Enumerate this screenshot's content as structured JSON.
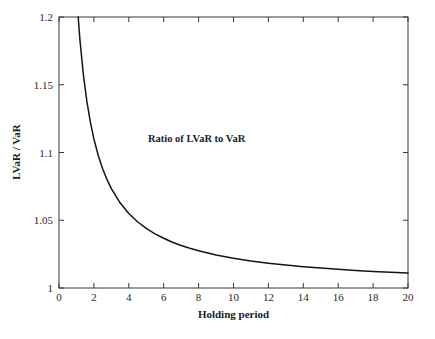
{
  "chart_data": {
    "type": "line",
    "title": "",
    "xlabel": "Holding period",
    "ylabel": "LVaR / VaR",
    "xlim": [
      0,
      20
    ],
    "ylim": [
      1,
      1.2
    ],
    "grid": false,
    "legend_position": "none",
    "annotations": [
      {
        "text": "Ratio of LVaR to VaR",
        "x": 5.1,
        "y": 1.108
      }
    ],
    "xticks": [
      "0",
      "2",
      "4",
      "6",
      "8",
      "10",
      "12",
      "14",
      "16",
      "18",
      "20"
    ],
    "xtick_values": [
      0,
      2,
      4,
      6,
      8,
      10,
      12,
      14,
      16,
      18,
      20
    ],
    "yticks": [
      "1",
      "1.05",
      "1.1",
      "1.15",
      "1.2"
    ],
    "ytick_values": [
      1,
      1.05,
      1.1,
      1.15,
      1.2
    ],
    "series": [
      {
        "name": "Ratio of LVaR to VaR",
        "formula": "1 + 0.22/t",
        "color": "#151313",
        "x": [
          1.1,
          1.2,
          1.4,
          1.6,
          1.8,
          2.0,
          2.25,
          2.5,
          2.75,
          3.0,
          3.5,
          4.0,
          4.5,
          5.0,
          5.5,
          6.0,
          6.5,
          7.0,
          7.5,
          8.0,
          9.0,
          10.0,
          11.0,
          12.0,
          13.0,
          14.0,
          15.0,
          16.0,
          17.0,
          18.0,
          19.0,
          20.0
        ],
        "values": [
          1.2,
          1.183,
          1.157,
          1.1375,
          1.1222,
          1.11,
          1.0978,
          1.088,
          1.08,
          1.0733,
          1.0629,
          1.055,
          1.0489,
          1.044,
          1.04,
          1.0367,
          1.0338,
          1.0314,
          1.0293,
          1.0275,
          1.0244,
          1.022,
          1.02,
          1.0183,
          1.0169,
          1.0157,
          1.0147,
          1.0138,
          1.0129,
          1.0122,
          1.0116,
          1.011
        ]
      }
    ]
  },
  "axes": {
    "x_title": "Holding period",
    "y_title": "LVaR / VaR"
  },
  "annotation": {
    "curve_label": "Ratio of LVaR to VaR"
  },
  "ticks": {
    "x": [
      "0",
      "2",
      "4",
      "6",
      "8",
      "10",
      "12",
      "14",
      "16",
      "18",
      "20"
    ],
    "y": [
      "1",
      "1.05",
      "1.1",
      "1.15",
      "1.2"
    ]
  },
  "colors": {
    "curve": "#151313",
    "frame": "#3a3838",
    "text": "#201d1e",
    "background": "#ffffff"
  }
}
